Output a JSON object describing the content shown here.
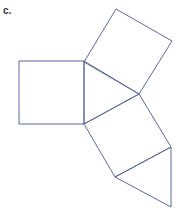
{
  "figure": {
    "label": "c.",
    "stroke_color": "#5a6a9a",
    "shapes": [
      {
        "name": "top-square",
        "points": "116,9 172,41 139,94 84,62"
      },
      {
        "name": "left-square",
        "points": "19,61 84,61 84,124 19,124"
      },
      {
        "name": "center-triangle",
        "points": "84,61 139,94 84,124"
      },
      {
        "name": "lower-square",
        "points": "84,124 139,94 171,147 115,177"
      },
      {
        "name": "bottom-triangle",
        "points": "115,177 171,147 171,207"
      }
    ]
  }
}
